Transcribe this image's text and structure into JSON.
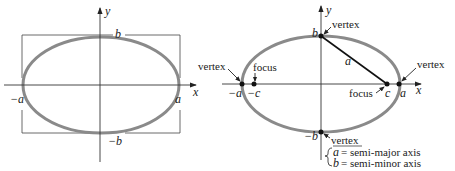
{
  "colors": {
    "ellipse": "#8a8a8a",
    "axis": "#333333",
    "ink": "#222222",
    "background": "#ffffff"
  },
  "left_diagram": {
    "axis_x_label": "x",
    "axis_y_label": "y",
    "label_pos_a": "a",
    "label_neg_a": "−a",
    "label_pos_b": "b",
    "label_neg_b": "−b"
  },
  "right_diagram": {
    "axis_x_label": "x",
    "axis_y_label": "y",
    "label_pos_a": "a",
    "label_neg_a": "−a",
    "label_pos_b": "b",
    "label_neg_b": "−b",
    "label_pos_c": "c",
    "label_neg_c": "−c",
    "segment_label": "a",
    "vertex_top": "vertex",
    "vertex_left": "vertex",
    "vertex_right": "vertex",
    "vertex_bottom": "vertex",
    "focus_left": "focus",
    "focus_right": "focus",
    "legend": {
      "line1_var": "a",
      "line1_text": "= semi-major axis",
      "line2_var": "b",
      "line2_text": "= semi-minor axis"
    }
  }
}
